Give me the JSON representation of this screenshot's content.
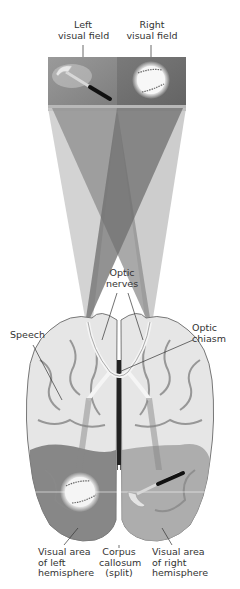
{
  "labels": {
    "left_visual_field": [
      "Left",
      "visual field"
    ],
    "right_visual_field": [
      "Right",
      "visual field"
    ],
    "optic_nerves": [
      "Optic",
      "nerves"
    ],
    "optic_chiasm": [
      "Optic",
      "chiasm"
    ],
    "speech": [
      "Speech"
    ],
    "visual_area_left": [
      "Visual area",
      "of left",
      "hemisphere"
    ],
    "corpus_callosum": [
      "Corpus",
      "callosum",
      "(split)"
    ],
    "visual_area_right": [
      "Visual area",
      "of right",
      "hemisphere"
    ]
  },
  "objects": {
    "left_field_object": "hammer-icon",
    "right_field_object": "baseball-icon",
    "left_hemisphere_object": "baseball-icon",
    "right_hemisphere_object": "hammer-icon"
  },
  "colors": {
    "left_field_bg": "#8a8a8a",
    "right_field_bg": "#6e6e6e",
    "brain_light": "#e8e8e8",
    "brain_fold": "#8c8c8c",
    "visual_area_left": "#7a7a7a",
    "visual_area_right": "#a8a8a8"
  }
}
